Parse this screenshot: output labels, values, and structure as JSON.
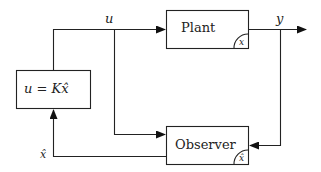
{
  "diagram": {
    "type": "block-diagram",
    "blocks": {
      "plant": {
        "label": "Plant",
        "corner_state": "x"
      },
      "observer": {
        "label": "Observer",
        "corner_state": "x̂"
      },
      "controller": {
        "label": "u = Kx̂"
      }
    },
    "signals": {
      "u": "u",
      "y": "y",
      "xhat": "x̂"
    },
    "colors": {
      "stroke": "#222222",
      "background": "#ffffff"
    }
  }
}
